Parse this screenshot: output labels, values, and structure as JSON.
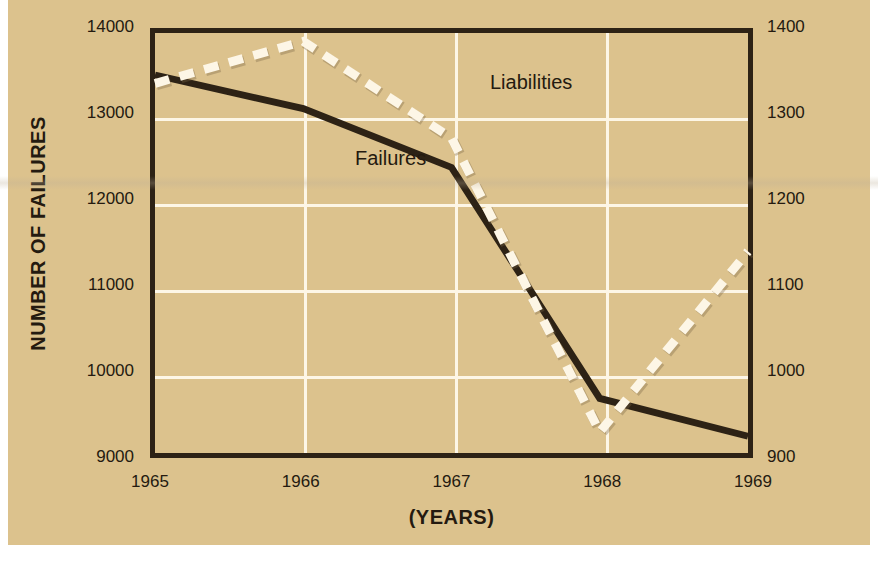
{
  "chart_data": {
    "type": "line",
    "title": "",
    "xlabel": "(YEARS)",
    "ylabel": "NUMBER OF FAILURES",
    "ylabel_right": "(MILLIONS OF DOLLARS)",
    "categories": [
      "1965",
      "1966",
      "1967",
      "1968",
      "1969"
    ],
    "x_tick_labels": [
      "1965",
      "1966",
      "1967",
      "1968",
      "1969"
    ],
    "y_tick_labels_left": [
      "14000",
      "13000",
      "12000",
      "11000",
      "10000",
      "9000"
    ],
    "y_tick_labels_right": [
      "1400",
      "1300",
      "1200",
      "1100",
      "1000",
      "900"
    ],
    "ylim": [
      9000,
      14000
    ],
    "ylim_right": [
      900,
      1400
    ],
    "grid": true,
    "legend_position": "inline-annotations",
    "series": [
      {
        "name": "Failures",
        "axis": "left",
        "style": "solid",
        "color": "#2d2215",
        "values": [
          13500,
          13100,
          12400,
          9650,
          9200
        ]
      },
      {
        "name": "Liabilities",
        "axis": "right",
        "style": "dashed",
        "color": "#fdf6e6",
        "values": [
          1340,
          1390,
          1275,
          925,
          1140
        ]
      }
    ],
    "annotations": [
      {
        "text": "Failures",
        "series": "Failures"
      },
      {
        "text": "Liabilities",
        "series": "Liabilities"
      }
    ]
  },
  "colors": {
    "paper": "#dcc28d",
    "ink": "#2d2215",
    "grid": "#fdf6e6",
    "page": "#ffffff"
  }
}
